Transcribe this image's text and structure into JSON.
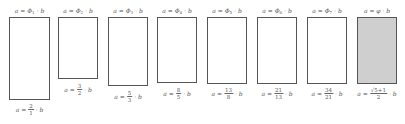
{
  "diagram": {
    "rectangles": [
      {
        "top_label": "a = Φ",
        "subscript": "1",
        "top_suffix": "· b",
        "ratio_num": "2",
        "ratio_den": "1",
        "left": 9,
        "width": 41,
        "height": 83,
        "label_top": 103,
        "golden": false
      },
      {
        "top_label": "a = Φ",
        "subscript": "2",
        "top_suffix": "· b",
        "ratio_num": "3",
        "ratio_den": "2",
        "left": 58,
        "width": 40,
        "height": 62,
        "label_top": 83,
        "golden": false
      },
      {
        "top_label": "a = Φ",
        "subscript": "3",
        "top_suffix": "· b",
        "ratio_num": "5",
        "ratio_den": "3",
        "left": 108,
        "width": 40,
        "height": 69,
        "label_top": 90,
        "golden": false
      },
      {
        "top_label": "a = Φ",
        "subscript": "4",
        "top_suffix": "· b",
        "ratio_num": "8",
        "ratio_den": "5",
        "left": 157,
        "width": 40,
        "height": 66,
        "label_top": 87,
        "golden": false
      },
      {
        "top_label": "a = Φ",
        "subscript": "5",
        "top_suffix": "· b",
        "ratio_num": "13",
        "ratio_den": "8",
        "left": 207,
        "width": 40,
        "height": 67,
        "label_top": 87,
        "golden": false
      },
      {
        "top_label": "a = Φ",
        "subscript": "6",
        "top_suffix": "· b",
        "ratio_num": "21",
        "ratio_den": "13",
        "left": 257,
        "width": 40,
        "height": 67,
        "label_top": 87,
        "golden": false
      },
      {
        "top_label": "a = Φ",
        "subscript": "7",
        "top_suffix": "· b",
        "ratio_num": "34",
        "ratio_den": "21",
        "left": 307,
        "width": 40,
        "height": 67,
        "label_top": 87,
        "golden": false
      },
      {
        "top_label": "a = φ",
        "subscript": "",
        "top_suffix": "· b",
        "ratio_num": "√5+1",
        "ratio_den": "2",
        "left": 357,
        "width": 40,
        "height": 67,
        "label_top": 87,
        "golden": true
      }
    ],
    "bottom_prefix": "a =",
    "bottom_suffix": "· b",
    "colors": {
      "border": "#555555",
      "golden_fill": "#cfcfcf"
    }
  }
}
